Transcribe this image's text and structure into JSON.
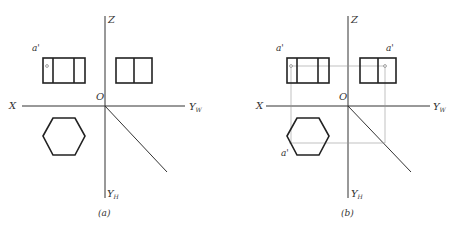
{
  "figure": {
    "panels": [
      {
        "id": "a",
        "caption": "(a)",
        "labels": {
          "z": "Z",
          "x": "X",
          "origin": "O",
          "yw": "Y",
          "yw_sub": "W",
          "yh": "Y",
          "yh_sub": "H",
          "point_front": "a'"
        }
      },
      {
        "id": "b",
        "caption": "(b)",
        "labels": {
          "z": "Z",
          "x": "X",
          "origin": "O",
          "yw": "Y",
          "yw_sub": "W",
          "yh": "Y",
          "yh_sub": "H",
          "point_front": "a'",
          "point_side": "a'",
          "point_top": "a'"
        }
      }
    ],
    "colors": {
      "line": "#222222",
      "construction": "#999999",
      "background": "#ffffff"
    }
  }
}
